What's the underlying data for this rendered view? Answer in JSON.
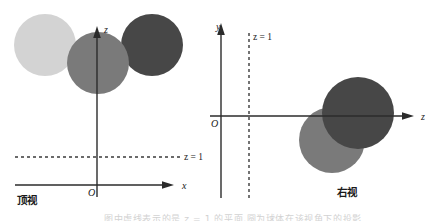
{
  "figure": {
    "background_color": "#ffffff",
    "axis_color": "#2b2b2b",
    "panels": [
      {
        "id": "top-view",
        "caption": "顶视",
        "caption_meaning": "top view",
        "horizontal_axis_label": "x",
        "vertical_axis_label": "z",
        "origin_label": "O",
        "dashed_line_label": "z = 1",
        "circles": [
          {
            "name": "light-circle",
            "color": "#d3d3d3",
            "cx": 45,
            "cy": 45,
            "r": 31
          },
          {
            "name": "medium-circle",
            "color": "#7a7a7a",
            "cx": 98,
            "cy": 63,
            "r": 31
          },
          {
            "name": "dark-circle",
            "color": "#474747",
            "cx": 152,
            "cy": 45,
            "r": 31
          }
        ]
      },
      {
        "id": "right-view",
        "caption": "右视",
        "caption_meaning": "right view",
        "horizontal_axis_label": "z",
        "vertical_axis_label": "y",
        "origin_label": "O",
        "dashed_line_label": "z = 1",
        "circles": [
          {
            "name": "medium-circle",
            "color": "#7a7a7a",
            "cx": 332,
            "cy": 140,
            "r": 33
          },
          {
            "name": "dark-circle",
            "color": "#474747",
            "cx": 358,
            "cy": 113,
            "r": 36
          }
        ]
      }
    ],
    "footer_text_partial": "图中虚线表示的是 z = 1 的平面,圆为球体在该视角下的投影"
  }
}
